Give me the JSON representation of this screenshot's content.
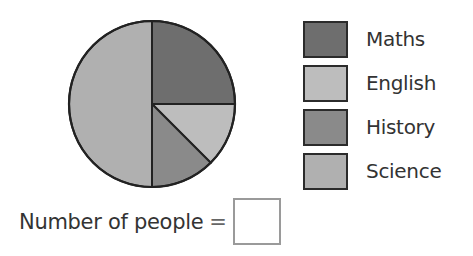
{
  "chart_data": {
    "type": "pie",
    "title": "",
    "categories": [
      "Maths",
      "English",
      "History",
      "Science"
    ],
    "values": [
      25,
      12.5,
      12.5,
      50
    ],
    "unit": "percent of circle",
    "fractions": [
      "1/4",
      "1/8",
      "1/8",
      "1/2"
    ],
    "colors": [
      "#6e6e6e",
      "#bdbdbd",
      "#8a8a8a",
      "#b0b0b0"
    ],
    "start_angle_deg": 0,
    "direction": "clockwise from 12 o'clock",
    "legend_position": "right"
  },
  "legend": {
    "items": [
      {
        "label": "Maths",
        "color": "#6e6e6e"
      },
      {
        "label": "English",
        "color": "#bdbdbd"
      },
      {
        "label": "History",
        "color": "#8a8a8a"
      },
      {
        "label": "Science",
        "color": "#b0b0b0"
      }
    ]
  },
  "question": {
    "label": "Number of people",
    "operator": "=",
    "answer_value": ""
  }
}
